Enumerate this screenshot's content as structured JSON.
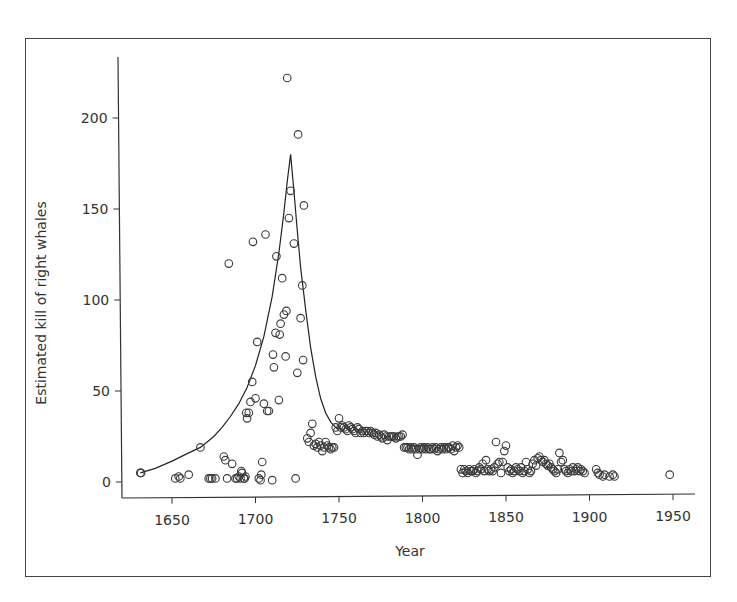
{
  "chart_data": {
    "type": "scatter",
    "title": "",
    "xlabel": "Year",
    "ylabel": "Estimated kill of right whales",
    "xlim": [
      1637,
      1963
    ],
    "ylim": [
      -9,
      230
    ],
    "xticks": [
      1650,
      1700,
      1750,
      1800,
      1850,
      1900,
      1950
    ],
    "yticks": [
      0,
      50,
      100,
      150,
      200
    ],
    "grid": false,
    "legend": null,
    "series": [
      {
        "name": "Estimated kill (points)",
        "kind": "scatter",
        "marker": "open-circle",
        "points": [
          [
            1631,
            5
          ],
          [
            1631.5,
            5
          ],
          [
            1652,
            2
          ],
          [
            1654,
            3
          ],
          [
            1655,
            2
          ],
          [
            1660,
            4
          ],
          [
            1667,
            19
          ],
          [
            1672,
            2
          ],
          [
            1673,
            2
          ],
          [
            1674,
            2
          ],
          [
            1676,
            2
          ],
          [
            1681,
            14
          ],
          [
            1682,
            12
          ],
          [
            1683,
            2
          ],
          [
            1684,
            120
          ],
          [
            1686,
            10
          ],
          [
            1688,
            2
          ],
          [
            1689,
            2
          ],
          [
            1690,
            3
          ],
          [
            1691,
            2
          ],
          [
            1691.5,
            6
          ],
          [
            1692,
            5
          ],
          [
            1693,
            2
          ],
          [
            1693.5,
            2
          ],
          [
            1694,
            3
          ],
          [
            1694.5,
            38
          ],
          [
            1695,
            35
          ],
          [
            1696,
            38
          ],
          [
            1697,
            44
          ],
          [
            1698,
            55
          ],
          [
            1698.5,
            132
          ],
          [
            1700,
            46
          ],
          [
            1701,
            77
          ],
          [
            1702,
            2
          ],
          [
            1703,
            1
          ],
          [
            1703.5,
            4
          ],
          [
            1704,
            11
          ],
          [
            1705,
            43
          ],
          [
            1706,
            136
          ],
          [
            1707,
            39
          ],
          [
            1708,
            39
          ],
          [
            1710,
            1
          ],
          [
            1710.5,
            70
          ],
          [
            1711,
            63
          ],
          [
            1712,
            82
          ],
          [
            1712.5,
            124
          ],
          [
            1714,
            45
          ],
          [
            1714.5,
            81
          ],
          [
            1715,
            87
          ],
          [
            1716,
            112
          ],
          [
            1717,
            92
          ],
          [
            1718,
            69
          ],
          [
            1718.5,
            94
          ],
          [
            1719,
            222
          ],
          [
            1720,
            145
          ],
          [
            1721,
            160
          ],
          [
            1723,
            131
          ],
          [
            1724,
            2
          ],
          [
            1725,
            60
          ],
          [
            1725.5,
            191
          ],
          [
            1727,
            90
          ],
          [
            1728,
            108
          ],
          [
            1728.5,
            67
          ],
          [
            1729,
            152
          ],
          [
            1731,
            24
          ],
          [
            1732,
            22
          ],
          [
            1733,
            27
          ],
          [
            1734,
            32
          ],
          [
            1735,
            20
          ],
          [
            1736,
            21
          ],
          [
            1737,
            19
          ],
          [
            1738,
            22
          ],
          [
            1739,
            20
          ],
          [
            1740,
            17
          ],
          [
            1741,
            19
          ],
          [
            1742,
            22
          ],
          [
            1743,
            20
          ],
          [
            1744,
            19
          ],
          [
            1745,
            18
          ],
          [
            1746,
            19
          ],
          [
            1747,
            19
          ],
          [
            1748,
            30
          ],
          [
            1749,
            28
          ],
          [
            1750,
            35
          ],
          [
            1751,
            30
          ],
          [
            1752,
            31
          ],
          [
            1753,
            30
          ],
          [
            1754,
            29
          ],
          [
            1755,
            28
          ],
          [
            1756,
            31
          ],
          [
            1757,
            30
          ],
          [
            1758,
            29
          ],
          [
            1759,
            28
          ],
          [
            1760,
            27
          ],
          [
            1761,
            30
          ],
          [
            1762,
            29
          ],
          [
            1763,
            27
          ],
          [
            1764,
            28
          ],
          [
            1765,
            27
          ],
          [
            1766,
            28
          ],
          [
            1767,
            28
          ],
          [
            1768,
            27
          ],
          [
            1769,
            28
          ],
          [
            1770,
            27
          ],
          [
            1771,
            26
          ],
          [
            1772,
            27
          ],
          [
            1773,
            25
          ],
          [
            1774,
            26
          ],
          [
            1775,
            25
          ],
          [
            1776,
            24
          ],
          [
            1777,
            26
          ],
          [
            1778,
            25
          ],
          [
            1779,
            23
          ],
          [
            1780,
            25
          ],
          [
            1781,
            25
          ],
          [
            1782,
            25
          ],
          [
            1783,
            25
          ],
          [
            1784,
            24
          ],
          [
            1785,
            25
          ],
          [
            1786,
            25
          ],
          [
            1787,
            25
          ],
          [
            1788,
            26
          ],
          [
            1789,
            19
          ],
          [
            1790,
            19
          ],
          [
            1791,
            19
          ],
          [
            1792,
            18
          ],
          [
            1793,
            19
          ],
          [
            1794,
            18
          ],
          [
            1795,
            19
          ],
          [
            1796,
            18
          ],
          [
            1797,
            15
          ],
          [
            1798,
            18
          ],
          [
            1799,
            19
          ],
          [
            1800,
            18
          ],
          [
            1801,
            19
          ],
          [
            1802,
            18
          ],
          [
            1803,
            19
          ],
          [
            1804,
            18
          ],
          [
            1805,
            18
          ],
          [
            1806,
            19
          ],
          [
            1807,
            18
          ],
          [
            1808,
            19
          ],
          [
            1809,
            17
          ],
          [
            1810,
            18
          ],
          [
            1811,
            19
          ],
          [
            1812,
            18
          ],
          [
            1813,
            19
          ],
          [
            1814,
            18
          ],
          [
            1815,
            19
          ],
          [
            1816,
            19
          ],
          [
            1817,
            18
          ],
          [
            1818,
            20
          ],
          [
            1819,
            17
          ],
          [
            1820,
            19
          ],
          [
            1821,
            20
          ],
          [
            1822,
            19
          ],
          [
            1823,
            7
          ],
          [
            1824,
            5
          ],
          [
            1825,
            7
          ],
          [
            1826,
            6
          ],
          [
            1827,
            5
          ],
          [
            1828,
            7
          ],
          [
            1829,
            6
          ],
          [
            1830,
            6
          ],
          [
            1831,
            7
          ],
          [
            1832,
            5
          ],
          [
            1833,
            6
          ],
          [
            1834,
            8
          ],
          [
            1835,
            7
          ],
          [
            1836,
            10
          ],
          [
            1837,
            6
          ],
          [
            1838,
            12
          ],
          [
            1839,
            7
          ],
          [
            1840,
            6
          ],
          [
            1841,
            7
          ],
          [
            1842,
            6
          ],
          [
            1843,
            8
          ],
          [
            1844,
            22
          ],
          [
            1845,
            10
          ],
          [
            1846,
            11
          ],
          [
            1847,
            5
          ],
          [
            1848,
            11
          ],
          [
            1849,
            17
          ],
          [
            1850,
            20
          ],
          [
            1851,
            8
          ],
          [
            1852,
            6
          ],
          [
            1853,
            7
          ],
          [
            1854,
            5
          ],
          [
            1855,
            6
          ],
          [
            1856,
            8
          ],
          [
            1857,
            7
          ],
          [
            1858,
            6
          ],
          [
            1859,
            8
          ],
          [
            1860,
            5
          ],
          [
            1861,
            6
          ],
          [
            1862,
            11
          ],
          [
            1863,
            7
          ],
          [
            1864,
            5
          ],
          [
            1865,
            6
          ],
          [
            1866,
            10
          ],
          [
            1867,
            12
          ],
          [
            1868,
            9
          ],
          [
            1869,
            13
          ],
          [
            1870,
            14
          ],
          [
            1871,
            12
          ],
          [
            1872,
            11
          ],
          [
            1873,
            12
          ],
          [
            1874,
            10
          ],
          [
            1875,
            9
          ],
          [
            1876,
            10
          ],
          [
            1877,
            8
          ],
          [
            1878,
            7
          ],
          [
            1879,
            6
          ],
          [
            1880,
            5
          ],
          [
            1881,
            7
          ],
          [
            1882,
            16
          ],
          [
            1883,
            11
          ],
          [
            1884,
            12
          ],
          [
            1885,
            7
          ],
          [
            1886,
            6
          ],
          [
            1887,
            5
          ],
          [
            1888,
            7
          ],
          [
            1889,
            6
          ],
          [
            1890,
            8
          ],
          [
            1891,
            6
          ],
          [
            1892,
            7
          ],
          [
            1893,
            8
          ],
          [
            1894,
            6
          ],
          [
            1895,
            7
          ],
          [
            1896,
            6
          ],
          [
            1897,
            5
          ],
          [
            1904,
            7
          ],
          [
            1905,
            5
          ],
          [
            1906,
            4
          ],
          [
            1908,
            3
          ],
          [
            1909,
            4
          ],
          [
            1912,
            3
          ],
          [
            1914,
            4
          ],
          [
            1915,
            3
          ],
          [
            1948,
            4
          ]
        ]
      },
      {
        "name": "Fitted model (curve)",
        "kind": "line",
        "points": [
          [
            1631,
            5
          ],
          [
            1640,
            7.5
          ],
          [
            1650,
            11.5
          ],
          [
            1660,
            16
          ],
          [
            1667,
            19
          ],
          [
            1675,
            25
          ],
          [
            1680,
            30
          ],
          [
            1685,
            36
          ],
          [
            1690,
            43
          ],
          [
            1695,
            52
          ],
          [
            1700,
            64
          ],
          [
            1705,
            80
          ],
          [
            1710,
            102
          ],
          [
            1714,
            126
          ],
          [
            1717,
            148
          ],
          [
            1719,
            165
          ],
          [
            1721,
            180
          ],
          [
            1723,
            160
          ],
          [
            1725,
            138
          ],
          [
            1727,
            118
          ],
          [
            1730,
            95
          ],
          [
            1733,
            74
          ],
          [
            1736,
            58
          ],
          [
            1739,
            46
          ],
          [
            1742,
            38
          ],
          [
            1745,
            33
          ],
          [
            1748,
            30
          ],
          [
            1750,
            29
          ]
        ]
      }
    ]
  },
  "colors": {
    "marker": "#3a3a3a",
    "line": "#222222",
    "axis": "#333333",
    "frame": "#444444",
    "background": "#ffffff"
  }
}
